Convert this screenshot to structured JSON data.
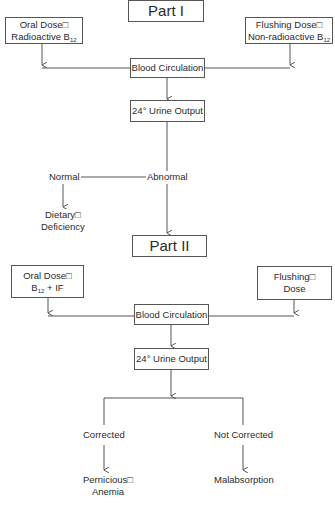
{
  "part1": {
    "title": "Part I",
    "oral_dose": {
      "line1": "Oral Dose□",
      "line2": "Radioactive B",
      "line2_sub": "12"
    },
    "flushing_dose": {
      "line1": "Flushing Dose□",
      "line2": "Non-radioactive B",
      "line2_sub": "12"
    },
    "blood_circulation": "Blood Circulation",
    "urine_output": "24° Urine Output",
    "normal": "Normal",
    "abnormal": "Abnormal",
    "dietary_deficiency": {
      "line1": "Dietary□",
      "line2": "Deficiency"
    }
  },
  "part2": {
    "title": "Part II",
    "oral_dose": {
      "line1": "Oral Dose□",
      "line2_pre": "B",
      "line2_sub": "12",
      "line2_post": " + IF"
    },
    "flushing_dose": {
      "line1": "Flushing□",
      "line2": "Dose"
    },
    "blood_circulation": "Blood Circulation",
    "urine_output": "24° Urine Output",
    "corrected": "Corrected",
    "not_corrected": "Not Corrected",
    "pernicious_anemia": {
      "line1": "Pernicious□",
      "line2": "Anemia"
    },
    "malabsorption": "Malabsorption"
  },
  "colors": {
    "line": "#555555",
    "text": "#2a2a2a",
    "background": "#ffffff"
  }
}
